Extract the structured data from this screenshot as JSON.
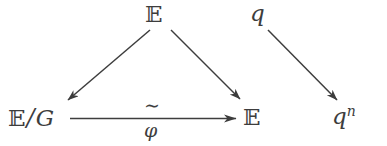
{
  "diagram": {
    "type": "commutative-diagram",
    "background_color": "#ffffff",
    "ink_color": "#3d3d3d",
    "nodes": [
      {
        "id": "top-e",
        "label": "ᴇ",
        "text": "𝔼",
        "symbol_name": "blackboard-bold-E",
        "position": "top-center"
      },
      {
        "id": "top-q",
        "text": "q",
        "symbol_name": "italic-q",
        "position": "top-right"
      },
      {
        "id": "bottom-eg",
        "text": "𝔼/G",
        "base": "𝔼",
        "separator": "/",
        "quotient": "G",
        "symbol_name": "E-mod-G",
        "position": "bottom-left"
      },
      {
        "id": "bottom-e",
        "text": "𝔼",
        "symbol_name": "blackboard-bold-E",
        "position": "bottom-center-right"
      },
      {
        "id": "bottom-qn",
        "text": "qⁿ",
        "base": "q",
        "exponent": "n",
        "symbol_name": "q-to-the-n",
        "position": "bottom-right"
      }
    ],
    "arrows": [
      {
        "id": "arrow-e-to-eg",
        "from": "top-e",
        "to": "bottom-eg",
        "direction": "down-left",
        "label": ""
      },
      {
        "id": "arrow-e-to-e",
        "from": "top-e",
        "to": "bottom-e",
        "direction": "down-right",
        "label": ""
      },
      {
        "id": "arrow-eg-to-e",
        "from": "bottom-eg",
        "to": "bottom-e",
        "direction": "right",
        "label_above": "∼",
        "label_below": "φ",
        "label_above_name": "tilde-iso",
        "label_below_name": "phi"
      },
      {
        "id": "arrow-q-to-qn",
        "from": "top-q",
        "to": "bottom-qn",
        "direction": "down-right",
        "label": ""
      }
    ]
  }
}
